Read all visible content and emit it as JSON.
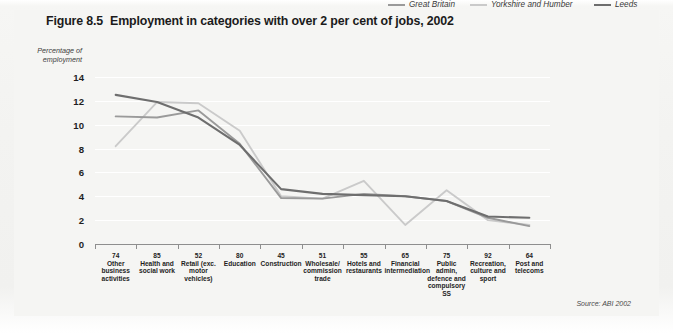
{
  "figure": {
    "number": "Figure 8.5",
    "title": "Employment in categories with over 2 per cent of jobs, 2002",
    "source": "Source: ABI 2002"
  },
  "axis": {
    "y_title_line1": "Percentage of",
    "y_title_line2": "employment",
    "y_ticks": [
      "0",
      "2",
      "4",
      "6",
      "8",
      "10",
      "12",
      "14"
    ]
  },
  "legend": {
    "items": [
      {
        "label": "Great Britain",
        "color": "#9a9a9a"
      },
      {
        "label": "Yorkshire and Humber",
        "color": "#cacaca"
      },
      {
        "label": "Leeds",
        "color": "#6e6e6e"
      }
    ]
  },
  "chart_data": {
    "type": "line",
    "title": "Employment in categories with over 2 per cent of jobs, 2002",
    "xlabel": "",
    "ylabel": "Percentage of employment",
    "ylim": [
      0,
      14
    ],
    "ytick_step": 2,
    "grid": true,
    "legend_position": "top-right",
    "categories": [
      {
        "code": "74",
        "name": "Other business activities"
      },
      {
        "code": "85",
        "name": "Health and social work"
      },
      {
        "code": "52",
        "name": "Retail (exc. motor vehicles)"
      },
      {
        "code": "80",
        "name": "Education"
      },
      {
        "code": "45",
        "name": "Construction"
      },
      {
        "code": "51",
        "name": "Wholesale/ commission trade"
      },
      {
        "code": "55",
        "name": "Hotels and restaurants"
      },
      {
        "code": "65",
        "name": "Financial intermediation"
      },
      {
        "code": "75",
        "name": "Public admin, defence and compulsory SS"
      },
      {
        "code": "92",
        "name": "Recreation, culture and sport"
      },
      {
        "code": "64",
        "name": "Post and telecoms"
      }
    ],
    "category_labels": [
      "Other business activities",
      "Health and social work",
      "Retail (exc. motor vehicles)",
      "Education",
      "Construction",
      "Wholesale/ commission trade",
      "Hotels and restaurants",
      "Financial intermediation",
      "Public admin, defence and compulsory SS",
      "Recreation, culture and sport",
      "Post and telecoms"
    ],
    "series": [
      {
        "name": "Great Britain",
        "color": "#9a9a9a",
        "values": [
          10.7,
          10.6,
          11.2,
          8.4,
          3.85,
          3.8,
          4.2,
          4.0,
          3.6,
          2.2,
          1.5
        ]
      },
      {
        "name": "Yorkshire and Humber",
        "color": "#cacaca",
        "values": [
          8.2,
          11.9,
          11.8,
          9.5,
          4.0,
          3.8,
          5.3,
          1.6,
          4.5,
          2.0,
          1.6
        ]
      },
      {
        "name": "Leeds",
        "color": "#6e6e6e",
        "values": [
          12.5,
          11.9,
          10.6,
          8.3,
          4.6,
          4.2,
          4.1,
          4.0,
          3.6,
          2.3,
          2.2
        ]
      }
    ]
  }
}
